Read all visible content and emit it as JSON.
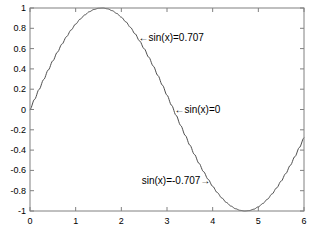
{
  "figure": {
    "background_color": "#ffffff",
    "axes_color": "#808080",
    "text_color": "#000000"
  },
  "chart_data": {
    "type": "line",
    "title": "",
    "xlabel": "",
    "ylabel": "",
    "xlim": [
      0,
      6
    ],
    "ylim": [
      -1,
      1
    ],
    "grid": false,
    "legend": null,
    "line_color": "#4d4d4d",
    "line_width": 1,
    "expression": "sin(x)",
    "x_ticks": [
      0,
      1,
      2,
      3,
      4,
      5,
      6
    ],
    "x_tick_labels": [
      "0",
      "1",
      "2",
      "3",
      "4",
      "5",
      "6"
    ],
    "y_ticks": [
      -1,
      -0.8,
      -0.6,
      -0.4,
      -0.2,
      0,
      0.2,
      0.4,
      0.6,
      0.8,
      1
    ],
    "y_tick_labels": [
      "-1",
      "-0.8",
      "-0.6",
      "-0.4",
      "-0.2",
      "0",
      "0.2",
      "0.4",
      "0.6",
      "0.8",
      "1"
    ],
    "series": [
      {
        "name": "sin(x)",
        "x": [
          0,
          0.1,
          0.2,
          0.3,
          0.4,
          0.5,
          0.6,
          0.7,
          0.8,
          0.9,
          1.0,
          1.1,
          1.2,
          1.3,
          1.4,
          1.5,
          1.6,
          1.7,
          1.8,
          1.9,
          2.0,
          2.1,
          2.2,
          2.3,
          2.4,
          2.5,
          2.6,
          2.7,
          2.8,
          2.9,
          3.0,
          3.1,
          3.2,
          3.3,
          3.4,
          3.5,
          3.6,
          3.7,
          3.8,
          3.9,
          4.0,
          4.1,
          4.2,
          4.3,
          4.4,
          4.5,
          4.6,
          4.7,
          4.8,
          4.9,
          5.0,
          5.1,
          5.2,
          5.3,
          5.4,
          5.5,
          5.6,
          5.7,
          5.8,
          5.9,
          6.0
        ],
        "y": [
          0,
          0.0998,
          0.1987,
          0.2955,
          0.3894,
          0.4794,
          0.5646,
          0.6442,
          0.7174,
          0.7833,
          0.8415,
          0.8912,
          0.932,
          0.9636,
          0.9854,
          0.9975,
          0.9996,
          0.9917,
          0.9738,
          0.9463,
          0.9093,
          0.8632,
          0.8085,
          0.7457,
          0.6755,
          0.5985,
          0.5155,
          0.4274,
          0.335,
          0.2392,
          0.1411,
          0.0416,
          -0.0584,
          -0.1577,
          -0.2555,
          -0.3508,
          -0.4425,
          -0.5298,
          -0.6119,
          -0.6878,
          -0.7568,
          -0.8183,
          -0.8716,
          -0.9162,
          -0.9516,
          -0.9775,
          -0.9937,
          -0.99992,
          -0.9962,
          -0.9825,
          -0.9589,
          -0.9258,
          -0.8835,
          -0.8323,
          -0.7728,
          -0.7055,
          -0.6313,
          -0.5507,
          -0.4646,
          -0.3739,
          -0.2794
        ]
      }
    ],
    "annotations": [
      {
        "id": "annotation-0707",
        "text": "←sin(x)=0.707",
        "point_x": 2.356,
        "point_y": 0.707,
        "arrow_direction": "left"
      },
      {
        "id": "annotation-0",
        "text": "←sin(x)=0",
        "point_x": 3.1416,
        "point_y": 0,
        "arrow_direction": "left"
      },
      {
        "id": "annotation-neg0707",
        "text": "sin(x)=-0.707→",
        "point_x": 3.927,
        "point_y": -0.707,
        "arrow_direction": "right"
      }
    ]
  }
}
